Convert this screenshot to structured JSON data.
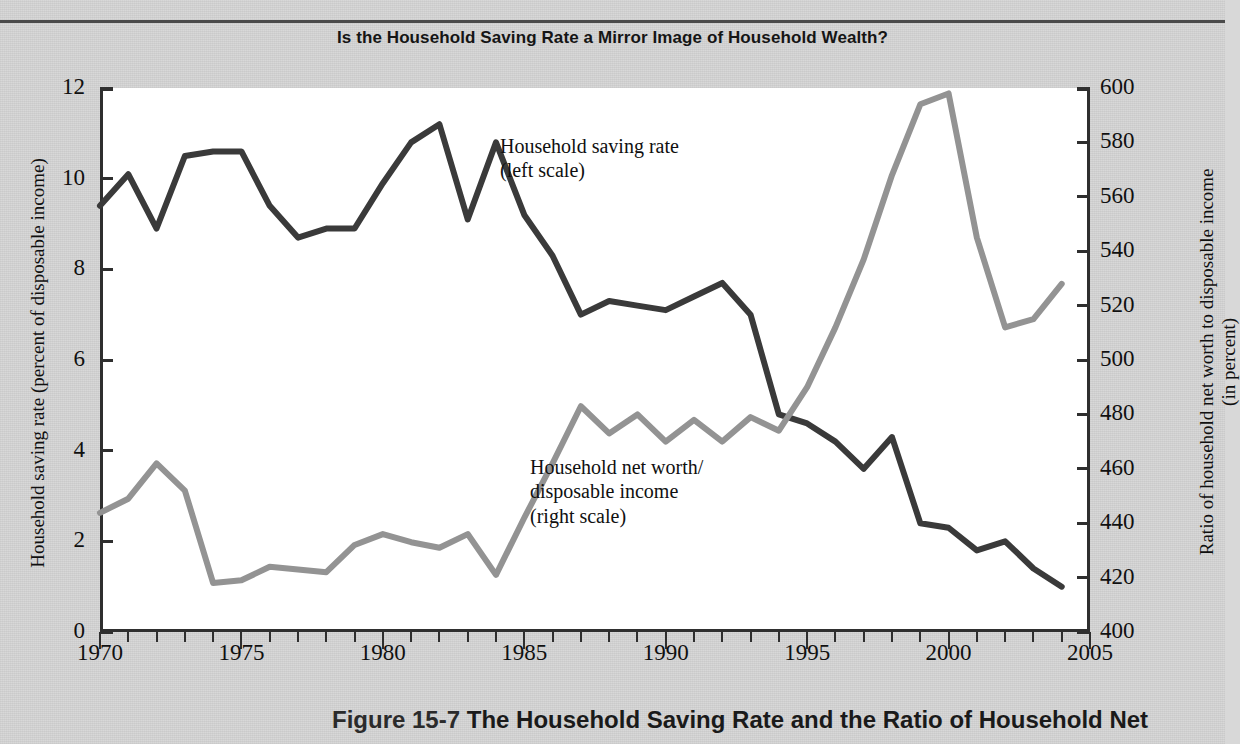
{
  "chart_title": "Is the Household Saving Rate a Mirror Image of Household Wealth?",
  "caption": {
    "figure_number": "Figure 15-7",
    "text": "The Household Saving Rate and the Ratio of Household Net"
  },
  "series_labels": {
    "saving": "Household saving rate",
    "saving_scale": "(left scale)",
    "networth_1": "Household net worth/",
    "networth_2": "disposable income",
    "networth_scale": "(right scale)"
  },
  "colors": {
    "saving_line": "#3a3a3a",
    "networth_line": "#939393",
    "axis": "#2f2f2f",
    "plot_bg": "#ffffff",
    "page_bg": "#d6d6d6"
  },
  "chart_data": {
    "type": "line",
    "title": "Is the Household Saving Rate a Mirror Image of Household Wealth?",
    "xlabel": "",
    "ylabel": "Household saving rate (percent of disposable income)",
    "y2label": "Ratio of household net worth to disposable income (in percent)",
    "xlim": [
      1970,
      2005
    ],
    "ylim": [
      0,
      12
    ],
    "y2lim": [
      400,
      600
    ],
    "grid": false,
    "legend": "inline-annotation",
    "x_ticks_major": [
      "1970",
      "1975",
      "1980",
      "1985",
      "1990",
      "1995",
      "2000",
      "2005"
    ],
    "x_ticks_major_values": [
      1970,
      1975,
      1980,
      1985,
      1990,
      1995,
      2000,
      2005
    ],
    "y_ticks_left": [
      "0",
      "2",
      "4",
      "6",
      "8",
      "10",
      "12"
    ],
    "y_ticks_left_values": [
      0,
      2,
      4,
      6,
      8,
      10,
      12
    ],
    "y_ticks_right": [
      "400",
      "420",
      "440",
      "460",
      "480",
      "500",
      "520",
      "540",
      "560",
      "580",
      "600"
    ],
    "y_ticks_right_values": [
      400,
      420,
      440,
      460,
      480,
      500,
      520,
      540,
      560,
      580,
      600
    ],
    "x": [
      1970,
      1971,
      1972,
      1973,
      1974,
      1975,
      1976,
      1977,
      1978,
      1979,
      1980,
      1981,
      1982,
      1983,
      1984,
      1985,
      1986,
      1987,
      1988,
      1989,
      1990,
      1991,
      1992,
      1993,
      1994,
      1995,
      1996,
      1997,
      1998,
      1999,
      2000,
      2001,
      2002,
      2003,
      2004
    ],
    "series": [
      {
        "name": "Household saving rate",
        "axis": "left",
        "unit": "percent of disposable income",
        "color": "#3a3a3a",
        "values": [
          9.4,
          10.1,
          8.9,
          10.5,
          10.6,
          10.6,
          9.4,
          8.7,
          8.9,
          8.9,
          9.9,
          10.8,
          11.2,
          9.1,
          10.8,
          9.2,
          8.3,
          7.0,
          7.3,
          7.2,
          7.1,
          7.4,
          7.7,
          7.0,
          4.8,
          4.6,
          4.2,
          3.6,
          4.3,
          2.4,
          2.3,
          1.8,
          2.0,
          1.4,
          1.0
        ]
      },
      {
        "name": "Household net worth/disposable income",
        "axis": "right",
        "unit": "percent",
        "color": "#939393",
        "values": [
          443.8,
          449.0,
          462.0,
          452.0,
          418.0,
          419.0,
          424.0,
          423.0,
          422.0,
          432.0,
          436.0,
          433.0,
          431.0,
          436.0,
          421.0,
          442.0,
          462.0,
          483.0,
          473.0,
          480.0,
          470.0,
          478.0,
          470.0,
          479.0,
          474.0,
          490.0,
          512.0,
          537.0,
          568.0,
          594.0,
          598.0,
          545.0,
          512.0,
          515.0,
          528.0
        ]
      }
    ]
  }
}
